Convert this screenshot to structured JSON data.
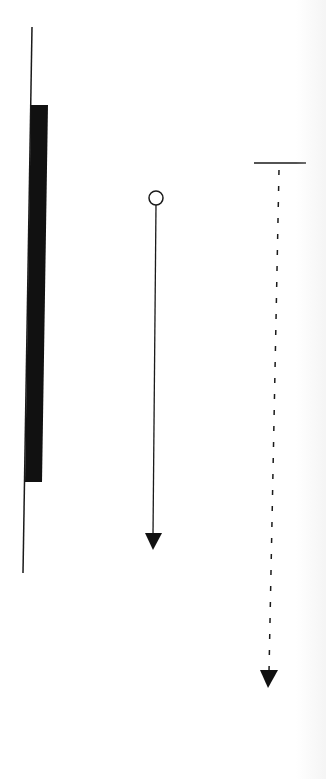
{
  "diagram": {
    "type": "uml-sequence-notation-fragment",
    "colors": {
      "stroke": "#1a1a1a",
      "fill": "#111111",
      "background": "#ffffff"
    },
    "elements": [
      {
        "id": "lifeline",
        "kind": "lifeline",
        "from": [
          32,
          27
        ],
        "to": [
          23,
          573
        ]
      },
      {
        "id": "activation-bar",
        "kind": "activation-bar",
        "points": [
          [
            31,
            105
          ],
          [
            48,
            105
          ],
          [
            42,
            482
          ],
          [
            25,
            482
          ]
        ]
      },
      {
        "id": "found-message",
        "kind": "solid-arrow-with-start-circle",
        "circle": {
          "cx": 156,
          "cy": 198,
          "r": 7
        },
        "from": [
          156,
          205
        ],
        "to": [
          153,
          533
        ],
        "arrowhead": [
          [
            145,
            533
          ],
          [
            162,
            533
          ],
          [
            153,
            550
          ]
        ]
      },
      {
        "id": "return-message",
        "kind": "dashed-arrow-with-start-bar",
        "bar": {
          "from": [
            254,
            163
          ],
          "to": [
            306,
            163
          ]
        },
        "from": [
          279,
          163
        ],
        "to": [
          269,
          670
        ],
        "dash": "5 11",
        "arrowhead": [
          [
            260,
            670
          ],
          [
            278,
            670
          ],
          [
            268,
            688
          ]
        ]
      }
    ]
  }
}
